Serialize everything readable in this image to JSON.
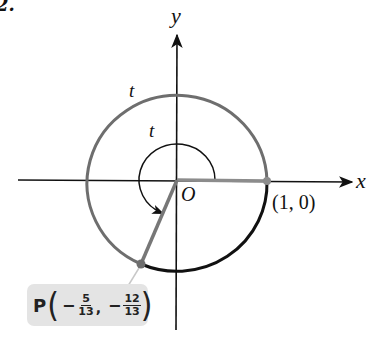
{
  "figure": {
    "number_label": "2.",
    "axis_labels": {
      "x": "x",
      "y": "y"
    },
    "origin_label": "O",
    "arc_label_outer": "t",
    "arc_label_inner": "t",
    "start_point_label": "(1, 0)",
    "terminal_point": {
      "name": "P",
      "x": {
        "sign": "−",
        "numerator": "5",
        "denominator": "13"
      },
      "y": {
        "sign": "−",
        "numerator": "12",
        "denominator": "13"
      },
      "comma": ","
    },
    "colors": {
      "axes": "#111111",
      "circle_traced_arc": "#6e6e6e",
      "circle_remaining_arc": "#111111",
      "radius_segments": "#8c8c8c",
      "label_box_bg": "#e4e4e4"
    }
  }
}
